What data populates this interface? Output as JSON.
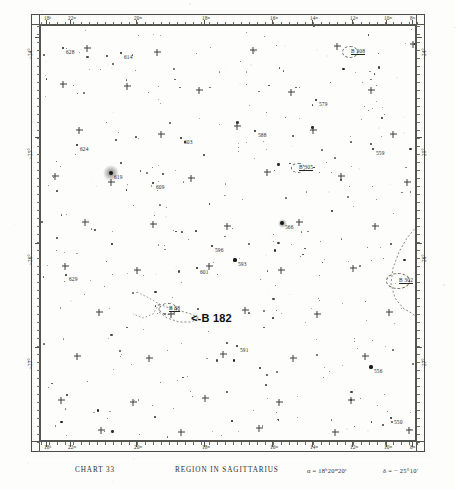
{
  "caption": {
    "chart_label": "CHART 33",
    "title": "REGION IN SAGITTARIUS",
    "ra_center": "α = 18ʰ20ᵐ20ˢ",
    "dec_center": "δ = − 25°10′"
  },
  "axes": {
    "x_label": "Right Ascension",
    "y_label": "Declination",
    "x_ticks_top": [
      "18ʰ",
      "22ᵐ",
      "20ᵐ",
      "18ᵐ",
      "16ᵐ",
      "14ᵐ",
      "12ᵐ",
      "10ᵐ",
      "8ᵐ"
    ],
    "x_ticks_bottom": [
      "18ʰ",
      "22ᵐ",
      "20ᵐ",
      "18ᵐ",
      "16ᵐ",
      "14ᵐ",
      "12ᵐ",
      "10ᵐ",
      "8ᵐ"
    ],
    "y_ticks_left": [
      "−24°",
      "−25°",
      "−26°",
      "−27°"
    ],
    "y_ticks_right": [
      "−24°",
      "−25°",
      "−26°",
      "−27°"
    ]
  },
  "chart_data": {
    "type": "scatter",
    "title": "REGION IN SAGITTARIUS",
    "subtitle": "CHART 33",
    "xlabel": "Right Ascension (18ʰ)",
    "ylabel": "Declination",
    "xlim": [
      "18h23m",
      "18h07m"
    ],
    "ylim": [
      -27.3,
      -23.7
    ],
    "grid": false,
    "legend": "none",
    "projection": "equatorial photographic plate",
    "annotations": [
      {
        "text": "<-B 182",
        "x": 190,
        "y": 318,
        "kind": "primary-pointer"
      }
    ],
    "dark_nebulae": [
      {
        "name": "B 308",
        "x": 348,
        "y": 50,
        "rx": 7,
        "ry": 5
      },
      {
        "name": "B 305",
        "x": 296,
        "y": 166,
        "rx": 6,
        "ry": 4
      },
      {
        "name": "B 302",
        "x": 396,
        "y": 279,
        "rx": 11,
        "ry": 7
      },
      {
        "name": "B 88",
        "x": 166,
        "y": 307,
        "rx": 8,
        "ry": 5
      }
    ],
    "labeled_stars": [
      {
        "label": "628",
        "x": 62,
        "y": 47,
        "mag": 3
      },
      {
        "label": "614",
        "x": 120,
        "y": 52,
        "mag": 3
      },
      {
        "label": "542",
        "x": 414,
        "y": 43,
        "mag": 3
      },
      {
        "label": "579",
        "x": 315,
        "y": 99,
        "mag": 3
      },
      {
        "label": "603",
        "x": 180,
        "y": 137,
        "mag": 3
      },
      {
        "label": "588",
        "x": 254,
        "y": 130,
        "mag": 3
      },
      {
        "label": "559",
        "x": 372,
        "y": 148,
        "mag": 3
      },
      {
        "label": "624",
        "x": 76,
        "y": 144,
        "mag": 3
      },
      {
        "label": "619",
        "x": 110,
        "y": 172,
        "mag": 6
      },
      {
        "label": "609",
        "x": 152,
        "y": 182,
        "mag": 3
      },
      {
        "label": "566",
        "x": 281,
        "y": 222,
        "mag": 5
      },
      {
        "label": "596",
        "x": 211,
        "y": 245,
        "mag": 3
      },
      {
        "label": "540",
        "x": 426,
        "y": 246,
        "mag": 3
      },
      {
        "label": "593",
        "x": 234,
        "y": 259,
        "mag": 4
      },
      {
        "label": "601",
        "x": 196,
        "y": 267,
        "mag": 3
      },
      {
        "label": "629",
        "x": 65,
        "y": 274,
        "mag": 3
      },
      {
        "label": "591",
        "x": 236,
        "y": 345,
        "mag": 3
      },
      {
        "label": "556",
        "x": 370,
        "y": 366,
        "mag": 4
      },
      {
        "label": "550",
        "x": 390,
        "y": 417,
        "mag": 3
      },
      {
        "label": "630",
        "x": 57,
        "y": 451,
        "mag": 3
      }
    ],
    "star_count_visible": 360
  },
  "colors": {
    "ink": "#1a1a18",
    "rule": "#55554f",
    "paper": "#fdfdfb",
    "annotation": "#0d0d0c"
  }
}
